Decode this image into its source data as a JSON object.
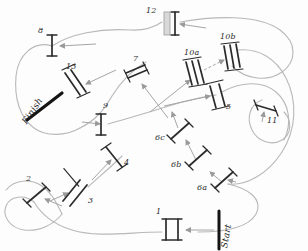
{
  "diagram": {
    "kind": "hand-drawn-whitewater-slalom-course",
    "colors": {
      "path": "#b3b3b3",
      "gate_pole": "#2e2e2e",
      "arrow": "#9a9a9a",
      "background": "#fdfdfd",
      "finish_bar": "#1c1c1c",
      "start_bar": "#1c1c1c",
      "gate12_fill": "#d8d8d8"
    },
    "markers": {
      "start_label": "Start",
      "finish_label": "Finish"
    },
    "gates": [
      {
        "id": "1",
        "label": "1",
        "type": "double",
        "x": 172,
        "y": 229,
        "angle": 0,
        "len": 22,
        "label_x": 156,
        "label_y": 213
      },
      {
        "id": "2",
        "label": "2",
        "type": "single",
        "x": 37,
        "y": 194,
        "angle": 52,
        "len": 20,
        "label_x": 26,
        "label_y": 178
      },
      {
        "id": "3",
        "label": "3",
        "type": "double",
        "x": 72,
        "y": 191,
        "angle": 25,
        "len": 22,
        "label_x": 88,
        "label_y": 199
      },
      {
        "id": "4",
        "label": "4",
        "type": "single",
        "x": 114,
        "y": 157,
        "angle": 38,
        "len": 21,
        "label_x": 124,
        "label_y": 161
      },
      {
        "id": "5",
        "label": "5",
        "type": "double",
        "x": 216,
        "y": 97,
        "angle": 15,
        "len": 22,
        "label_x": 226,
        "label_y": 105
      },
      {
        "id": "6a",
        "label": "6a",
        "type": "single",
        "x": 224,
        "y": 180,
        "angle": 50,
        "len": 19,
        "label_x": 203,
        "label_y": 189
      },
      {
        "id": "6b",
        "label": "6b",
        "type": "single",
        "x": 198,
        "y": 158,
        "angle": 50,
        "len": 19,
        "label_x": 177,
        "label_y": 165
      },
      {
        "id": "6c",
        "label": "6c",
        "type": "single",
        "x": 180,
        "y": 131,
        "angle": 50,
        "len": 19,
        "label_x": 159,
        "label_y": 139
      },
      {
        "id": "7",
        "label": "7",
        "type": "double",
        "x": 137,
        "y": 74,
        "angle": 80,
        "len": 20,
        "label_x": 136,
        "label_y": 59
      },
      {
        "id": "8",
        "label": "8",
        "type": "single",
        "x": 52,
        "y": 45,
        "angle": 5,
        "len": 20,
        "label_x": 40,
        "label_y": 30
      },
      {
        "id": "9",
        "label": "9",
        "type": "single",
        "x": 101,
        "y": 124,
        "angle": 3,
        "len": 20,
        "label_x": 105,
        "label_y": 105
      },
      {
        "id": "10a",
        "label": "10a",
        "type": "triple",
        "x": 194,
        "y": 73,
        "angle": 18,
        "len": 22,
        "label_x": 186,
        "label_y": 54
      },
      {
        "id": "10b",
        "label": "10b",
        "type": "triple",
        "x": 232,
        "y": 57,
        "angle": 13,
        "len": 22,
        "label_x": 222,
        "label_y": 39
      },
      {
        "id": "11",
        "label": "11",
        "type": "single",
        "x": 265,
        "y": 111,
        "angle": 75,
        "len": 20,
        "label_x": 269,
        "label_y": 122
      },
      {
        "id": "12",
        "label": "12",
        "type": "block",
        "x": 168,
        "y": 21,
        "angle": 0,
        "len": 22,
        "label_x": 148,
        "label_y": 12
      },
      {
        "id": "13",
        "label": "13",
        "type": "double",
        "x": 75,
        "y": 83,
        "angle": 22,
        "len": 22,
        "label_x": 68,
        "label_y": 66
      }
    ]
  }
}
